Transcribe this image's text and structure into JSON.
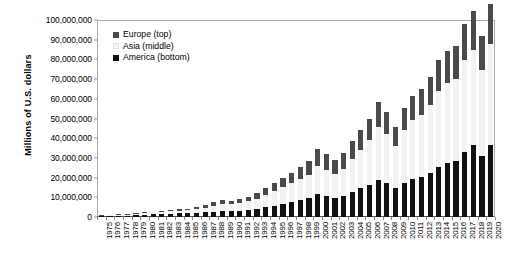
{
  "chart_data": {
    "type": "bar",
    "stacked": true,
    "title": "",
    "subtitle": "",
    "xlabel": "",
    "ylabel": "Millions of U.S. dollars",
    "ylim": [
      0,
      100000000
    ],
    "ytick_values": [
      0,
      10000000,
      20000000,
      30000000,
      40000000,
      50000000,
      60000000,
      70000000,
      80000000,
      90000000,
      100000000
    ],
    "ytick_labels": [
      "0",
      "10,000,000",
      "20,000,000",
      "30,000,000",
      "40,000,000",
      "50,000,000",
      "60,000,000",
      "70,000,000",
      "80,000,000",
      "90,000,000",
      "100,000,000"
    ],
    "grid": false,
    "legend_position": "inside-top-left",
    "legend": [
      {
        "name": "Europe (top)",
        "color": "#4a4a4a"
      },
      {
        "name": "Asia (middle)",
        "color": "#f2f2f2"
      },
      {
        "name": "America (bottom)",
        "color": "#111111"
      }
    ],
    "categories": [
      "1975",
      "1976",
      "1977",
      "1978",
      "1979",
      "1980",
      "1981",
      "1982",
      "1983",
      "1984",
      "1985",
      "1986",
      "1987",
      "1988",
      "1989",
      "1990",
      "1991",
      "1992",
      "1993",
      "1994",
      "1995",
      "1996",
      "1997",
      "1998",
      "1999",
      "2000",
      "2001",
      "2002",
      "2003",
      "2004",
      "2005",
      "2006",
      "2007",
      "2008",
      "2009",
      "2010",
      "2011",
      "2012",
      "2013",
      "2014",
      "2015",
      "2016",
      "2017",
      "2018",
      "2019",
      "2020"
    ],
    "series": [
      {
        "name": "America (bottom)",
        "color": "#111111",
        "values": [
          400000,
          500000,
          600000,
          700000,
          900000,
          1200000,
          1300000,
          1400000,
          1600000,
          1800000,
          1800000,
          2000000,
          2300000,
          2600000,
          2900000,
          3000000,
          3200000,
          3600000,
          4200000,
          5000000,
          5800000,
          6600000,
          7600000,
          8600000,
          9500000,
          11500000,
          10500000,
          9500000,
          10500000,
          12500000,
          14500000,
          16500000,
          19000000,
          17500000,
          14500000,
          17500000,
          19500000,
          20500000,
          22500000,
          25500000,
          27500000,
          28500000,
          33000000,
          36500000,
          31000000,
          36500000
        ]
      },
      {
        "name": "Asia (middle)",
        "color": "#f2f2f2",
        "values": [
          300000,
          350000,
          400000,
          500000,
          700000,
          900000,
          1000000,
          1100000,
          1300000,
          1500000,
          1600000,
          1900000,
          2500000,
          3200000,
          3500000,
          3400000,
          3700000,
          4300000,
          5200000,
          6300000,
          7300000,
          8400000,
          9700000,
          10800000,
          12000000,
          14500000,
          13500000,
          12500000,
          14000000,
          17000000,
          19500000,
          22500000,
          26500000,
          24500000,
          21500000,
          26500000,
          29500000,
          31500000,
          34500000,
          38500000,
          40500000,
          41500000,
          46500000,
          48500000,
          43500000,
          51500000
        ]
      },
      {
        "name": "Europe (top)",
        "color": "#4a4a4a",
        "values": [
          150000,
          180000,
          200000,
          250000,
          350000,
          450000,
          500000,
          550000,
          650000,
          750000,
          800000,
          1000000,
          1400000,
          1800000,
          2000000,
          1900000,
          2100000,
          2400000,
          2900000,
          3500000,
          4000000,
          4600000,
          5300000,
          6000000,
          6800000,
          8500000,
          7800000,
          7000000,
          7800000,
          9000000,
          10000000,
          11000000,
          13000000,
          11500000,
          9500000,
          11500000,
          12500000,
          13000000,
          14000000,
          15500000,
          16500000,
          17000000,
          18500000,
          19500000,
          17500000,
          20000000
        ]
      }
    ]
  },
  "axis": {
    "y_title": "Millions of U.S. dollars"
  }
}
